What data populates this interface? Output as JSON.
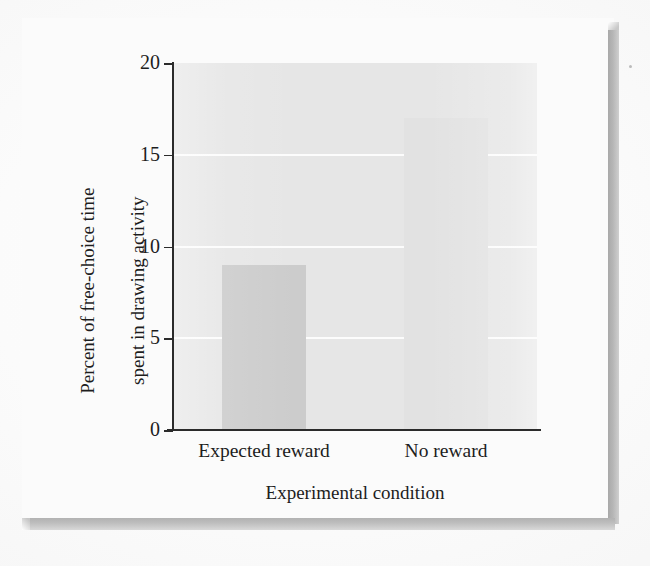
{
  "chart_data": {
    "type": "bar",
    "title": "",
    "subtitle": "",
    "xlabel": "Experimental condition",
    "ylabel": "Percent of free-choice time spent in drawing activity",
    "ylabel_lines": [
      "Percent of free-choice time",
      "spent in drawing activity"
    ],
    "categories": [
      "Expected reward",
      "No reward"
    ],
    "values": [
      9,
      17
    ],
    "ylim": [
      0,
      20
    ],
    "yticks": [
      0,
      5,
      10,
      15,
      20
    ],
    "ytick_labels": [
      "0",
      "5",
      "10",
      "15",
      "20"
    ],
    "grid": true,
    "grid_axis": "y",
    "grid_color": "#ffffff",
    "legend": false,
    "legend_position": "none",
    "bar_colors": [
      "#cccccc",
      "#e2e2e2"
    ],
    "plot_background": "#e6e6e6",
    "axis_color": "#2b2b2b",
    "text_color": "#1d1d1d"
  },
  "figure": {
    "page_background": "#ffffff",
    "card_background": "#fbfbfb",
    "shadow_color": "#b2b2b2"
  }
}
